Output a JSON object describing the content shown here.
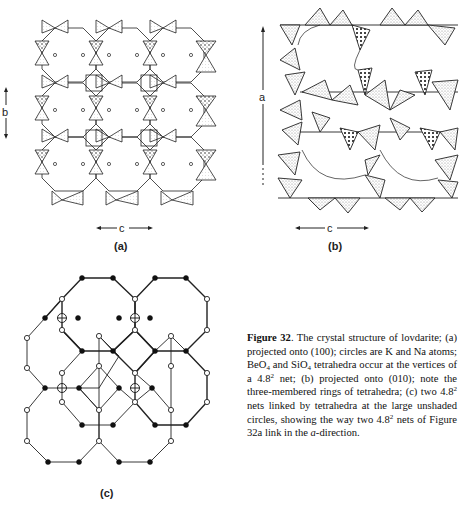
{
  "figure": {
    "number_label": "Figure 32",
    "caption_parts": {
      "p1": ". The crystal structure of lovdarite; (a) projected onto (100); circles are K and Na atoms; BeO",
      "sub1": "4",
      "p2": " and SiO",
      "sub2": "4",
      "p3": " tetrahedra occur at the vertices of a 4.8",
      "sup1": "2",
      "p4": " net; (b) projected onto (010); note the three-membered rings of tetrahedra; (c) two 4.8",
      "sup2": "2",
      "p5": " nets linked by tetrahedra at the large unshaded circles, showing the way two 4.8",
      "sup3": "2",
      "p6": " nets of Figure 32a link in the ",
      "italic_a": "a",
      "p7": "-direction."
    }
  },
  "panels": {
    "a": {
      "label": "(a)",
      "axis_vertical": "b",
      "axis_horizontal": "c",
      "description": "lovdarite projected onto (100), tetrahedra with K and Na atoms as circles"
    },
    "b": {
      "label": "(b)",
      "axis_vertical": "a",
      "axis_horizontal": "c",
      "description": "lovdarite projected onto (010), three-membered rings of tetrahedra"
    },
    "c": {
      "label": "(c)",
      "description": "two 4.8^2 nets linked by tetrahedra at large unshaded circles"
    }
  },
  "legend": {
    "filled_node": "black circle",
    "open_node": "white circle",
    "linking_node": "large unshaded circle with cross"
  }
}
